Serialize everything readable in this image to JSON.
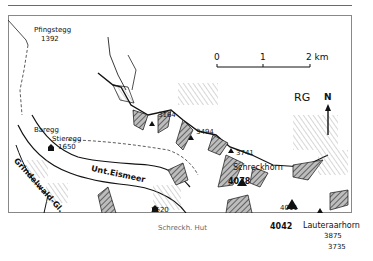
{
  "map": {
    "region_code": "RG",
    "north_label": "N",
    "scale": {
      "ticks": [
        "0",
        "1",
        "2 km"
      ]
    },
    "places": [
      {
        "name": "Pfingstegg",
        "elevation": "1392"
      },
      {
        "name": "Baregg"
      },
      {
        "name": "Stieregg",
        "elevation": "1650"
      },
      {
        "name": "Schreckh. Hut",
        "elevation": "2520"
      },
      {
        "name": "Schreckhorn",
        "elevation": "4078"
      },
      {
        "name": "Lauteraarhorn",
        "elevation": "4042"
      }
    ],
    "glaciers": [
      "Grindelwald-Gl.",
      "Unt.Eismeer"
    ],
    "peaks": [
      "3164",
      "3494",
      "3741",
      "4011",
      "3875",
      "3735"
    ]
  }
}
